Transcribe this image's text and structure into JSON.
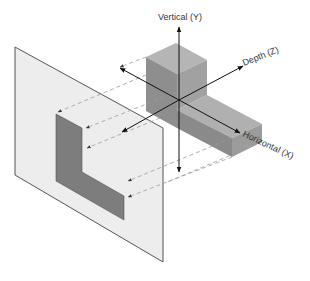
{
  "diagram": {
    "axes": {
      "vertical": "Vertical (Y)",
      "depth": "Depth (Z)",
      "horizontal": "Horizontal (X)"
    },
    "colors": {
      "plane_fill": "#ededed",
      "plane_stroke": "#555555",
      "block_top": "#a9a9a9",
      "block_front": "#8c8c8c",
      "block_side": "#9a9a9a",
      "projection_face": "#7d7d7d",
      "axis": "#111111",
      "projector": "#9a9a9a"
    }
  }
}
